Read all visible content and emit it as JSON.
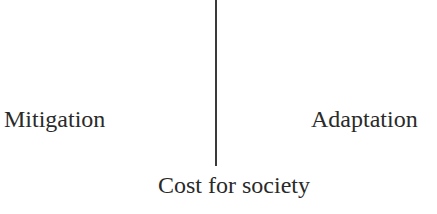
{
  "diagram": {
    "left_label": "Mitigation",
    "right_label": "Adaptation",
    "bottom_label": "Cost for society",
    "divider": {
      "orientation": "vertical",
      "color": "#3a3a3a"
    }
  }
}
